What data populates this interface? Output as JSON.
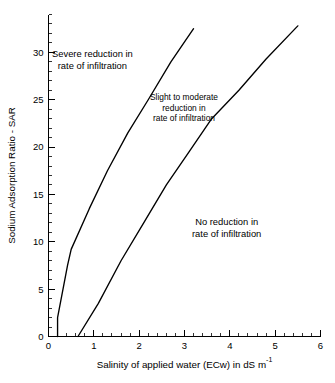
{
  "chart_data": {
    "type": "line",
    "title": "",
    "subtitle": "",
    "xlabel": "Salinity of applied water (ECw) in dS m",
    "xlabel_exponent": "-1",
    "ylabel": "Sodium Adsorption Ratio - SAR",
    "xlim": [
      0,
      6
    ],
    "ylim": [
      0,
      34
    ],
    "xticks": [
      0,
      1,
      2,
      3,
      4,
      5,
      6
    ],
    "xticklabels": [
      "0",
      "1",
      "2",
      "3",
      "4",
      "5",
      "6"
    ],
    "yticks": [
      0,
      5,
      10,
      15,
      20,
      25,
      30
    ],
    "yticklabels": [
      "0",
      "5",
      "10",
      "15",
      "20",
      "25",
      "30"
    ],
    "x_minor_interval": 0.2,
    "y_minor_interval": 1,
    "grid": false,
    "legend": false,
    "legend_position": "none",
    "axis_frame": "left-bottom",
    "tick_direction": "in",
    "line_color": "#000000",
    "background_color": "#ffffff",
    "series": [
      {
        "name": "Severe / Slight-to-moderate boundary",
        "points": [
          {
            "x": 0.2,
            "y": 0.0
          },
          {
            "x": 0.2,
            "y": 2.0
          },
          {
            "x": 0.32,
            "y": 5.0
          },
          {
            "x": 0.42,
            "y": 7.5
          },
          {
            "x": 0.5,
            "y": 9.2
          },
          {
            "x": 0.9,
            "y": 13.5
          },
          {
            "x": 1.3,
            "y": 17.5
          },
          {
            "x": 1.75,
            "y": 21.5
          },
          {
            "x": 2.2,
            "y": 25.0
          },
          {
            "x": 2.7,
            "y": 29.0
          },
          {
            "x": 3.2,
            "y": 32.5
          }
        ]
      },
      {
        "name": "Slight-to-moderate / No reduction boundary",
        "points": [
          {
            "x": 0.65,
            "y": 0.0
          },
          {
            "x": 1.1,
            "y": 3.5
          },
          {
            "x": 1.6,
            "y": 8.0
          },
          {
            "x": 2.1,
            "y": 12.0
          },
          {
            "x": 2.6,
            "y": 16.0
          },
          {
            "x": 3.1,
            "y": 19.5
          },
          {
            "x": 3.6,
            "y": 23.0
          },
          {
            "x": 4.2,
            "y": 26.0
          },
          {
            "x": 4.8,
            "y": 29.3
          },
          {
            "x": 5.5,
            "y": 32.8
          }
        ]
      }
    ],
    "annotations": [
      {
        "name": "severe-reduction",
        "lines": [
          "Severe reduction in",
          "rate of infiltration"
        ],
        "x": 1.0,
        "y": 29.0
      },
      {
        "name": "slight-to-moderate-reduction",
        "lines": [
          "Slight to moderate",
          "reduction in",
          "rate of infiltration"
        ],
        "x": 2.35,
        "y": 24.5
      },
      {
        "name": "no-reduction",
        "lines": [
          "No reduction in",
          "rate of infiltration"
        ],
        "x": 4.4,
        "y": 12.0
      }
    ]
  }
}
